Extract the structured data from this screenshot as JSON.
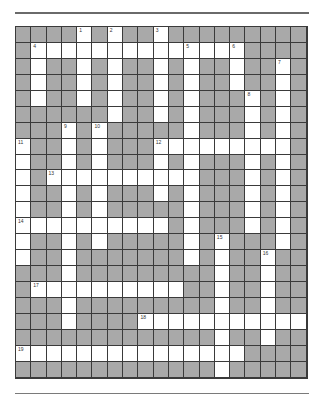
{
  "puzzle": {
    "rows": 22,
    "cols": 19,
    "colors": {
      "block": "#a9a9a9",
      "open": "#ffffff",
      "line": "#3a3a3a"
    },
    "open_cells": {
      "0": [
        4,
        6,
        9
      ],
      "1": [
        1,
        2,
        3,
        4,
        5,
        6,
        7,
        8,
        9,
        10,
        11,
        12,
        13,
        14
      ],
      "2": [
        1,
        4,
        6,
        9,
        11,
        14,
        17
      ],
      "3": [
        1,
        4,
        6,
        9,
        11,
        14,
        17
      ],
      "4": [
        1,
        4,
        6,
        9,
        11,
        15,
        17
      ],
      "5": [
        6,
        9,
        11,
        15,
        17
      ],
      "6": [
        3,
        5,
        11,
        15,
        17
      ],
      "7": [
        0,
        3,
        5,
        9,
        10,
        11,
        12,
        13,
        14,
        15,
        16,
        17
      ],
      "8": [
        0,
        3,
        5,
        9,
        11,
        15,
        17
      ],
      "9": [
        0,
        2,
        3,
        4,
        5,
        6,
        7,
        8,
        9,
        10,
        11,
        15,
        17
      ],
      "10": [
        0,
        3,
        5,
        9,
        11,
        15,
        17
      ],
      "11": [
        0,
        3,
        5,
        11,
        15,
        17
      ],
      "12": [
        0,
        1,
        2,
        3,
        4,
        5,
        6,
        7,
        8,
        9,
        11,
        15,
        17
      ],
      "13": [
        0,
        3,
        5,
        11,
        13,
        17
      ],
      "14": [
        0,
        3,
        11,
        13,
        16
      ],
      "15": [
        3,
        13,
        16
      ],
      "16": [
        1,
        2,
        3,
        4,
        5,
        6,
        7,
        8,
        9,
        10,
        13,
        16
      ],
      "17": [
        3,
        13,
        16
      ],
      "18": [
        3,
        8,
        9,
        10,
        11,
        12,
        13,
        14,
        15,
        16,
        17,
        18
      ],
      "19": [
        13,
        16
      ],
      "20": [
        0,
        1,
        2,
        3,
        4,
        5,
        6,
        7,
        8,
        9,
        10,
        11,
        12,
        13,
        14
      ],
      "21": [
        13
      ]
    },
    "clue_numbers": [
      {
        "n": "1",
        "r": 0,
        "c": 4
      },
      {
        "n": "2",
        "r": 0,
        "c": 6
      },
      {
        "n": "3",
        "r": 0,
        "c": 9
      },
      {
        "n": "4",
        "r": 1,
        "c": 1
      },
      {
        "n": "5",
        "r": 1,
        "c": 11
      },
      {
        "n": "6",
        "r": 1,
        "c": 14
      },
      {
        "n": "7",
        "r": 2,
        "c": 17
      },
      {
        "n": "8",
        "r": 4,
        "c": 15
      },
      {
        "n": "9",
        "r": 6,
        "c": 3
      },
      {
        "n": "10",
        "r": 6,
        "c": 5
      },
      {
        "n": "11",
        "r": 7,
        "c": 0
      },
      {
        "n": "12",
        "r": 7,
        "c": 9
      },
      {
        "n": "13",
        "r": 9,
        "c": 2
      },
      {
        "n": "14",
        "r": 12,
        "c": 0
      },
      {
        "n": "15",
        "r": 13,
        "c": 13
      },
      {
        "n": "16",
        "r": 14,
        "c": 16
      },
      {
        "n": "17",
        "r": 16,
        "c": 1
      },
      {
        "n": "18",
        "r": 18,
        "c": 8
      },
      {
        "n": "19",
        "r": 20,
        "c": 0
      }
    ]
  }
}
